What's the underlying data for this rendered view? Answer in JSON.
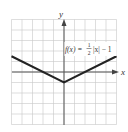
{
  "chart_data": {
    "type": "line",
    "title": "",
    "xlabel": "x",
    "ylabel": "y",
    "xlim": [
      -5,
      5
    ],
    "ylim": [
      -5,
      5
    ],
    "grid": true,
    "series": [
      {
        "name": "f(x) = 1/2 |x| - 1",
        "x": [
          -5,
          0,
          5
        ],
        "y": [
          1.5,
          -1,
          1.5
        ]
      }
    ],
    "annotations": [
      {
        "text": "f(x) = ½ |x| − 1",
        "x": 3.2,
        "y": 2.5
      }
    ]
  },
  "labels": {
    "x_axis": "x",
    "y_axis": "y",
    "func_prefix": "f(x) =",
    "func_num": "1",
    "func_den": "2",
    "func_suffix": "|x| − 1"
  },
  "colors": {
    "grid": "#c8c8c8",
    "axis": "#555555",
    "curve": "#222222"
  }
}
